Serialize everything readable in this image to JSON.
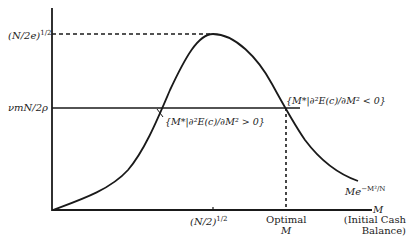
{
  "diagram": {
    "y_ticks": [
      {
        "label_base": "(N/2e)",
        "label_exp": "1/2",
        "y": 34
      },
      {
        "label": "νmN/2ρ",
        "y": 108
      }
    ],
    "x_ticks": [
      {
        "label_base": "(N/2)",
        "label_exp": "1/2",
        "x": 213
      },
      {
        "label_line1": "Optimal",
        "label_line2": "M",
        "x": 286
      }
    ],
    "x_axis": {
      "symbol": "M",
      "label_line1": "(Initial Cash",
      "label_line2": "Balance)"
    },
    "curve_label": {
      "base": "Me",
      "exp": "−M²/N"
    },
    "annotations": {
      "convex_region": "{M*|∂²E(c)/∂M² > 0}",
      "concave_region": "{M*|∂²E(c)/∂M² < 0}"
    },
    "colors": {
      "line": "#1a1a1a",
      "background": "#ffffff"
    }
  }
}
